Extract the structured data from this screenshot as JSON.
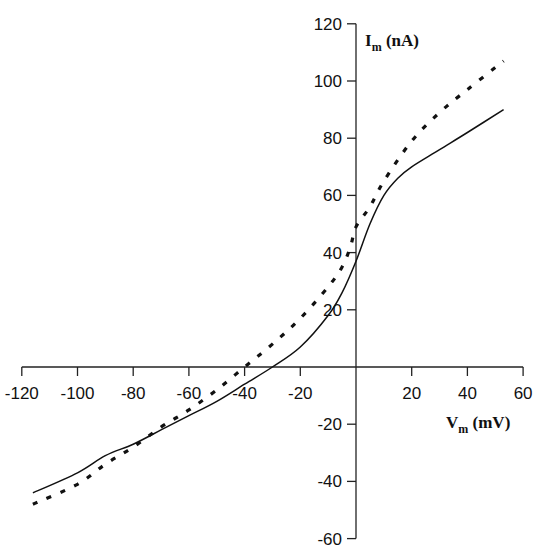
{
  "chart_data": {
    "type": "line",
    "title": "",
    "xlabel": "V_m (mV)",
    "ylabel": "I_m (nA)",
    "xlabel_main": "V",
    "xlabel_sub": "m",
    "xlabel_unit": " (mV)",
    "ylabel_main": "I",
    "ylabel_sub": "m",
    "ylabel_unit": " (nA)",
    "xlim": [
      -120,
      60
    ],
    "ylim": [
      -60,
      120
    ],
    "x_ticks": [
      -120,
      -100,
      -80,
      -60,
      -40,
      -20,
      20,
      40,
      60
    ],
    "y_ticks": [
      120,
      100,
      80,
      60,
      40,
      20,
      -20,
      -40,
      -60
    ],
    "grid": false,
    "legend": null,
    "series": [
      {
        "name": "solid",
        "style": "solid",
        "x": [
          -116,
          -100,
          -90,
          -80,
          -70,
          -60,
          -50,
          -40,
          -30,
          -20,
          -10,
          -5,
          0,
          5,
          10,
          15,
          20,
          30,
          40,
          53
        ],
        "y": [
          -44,
          -37,
          -31,
          -27,
          -22,
          -17,
          -12,
          -6,
          0,
          7,
          18,
          26,
          37,
          50,
          60,
          66,
          70,
          76,
          82,
          90
        ]
      },
      {
        "name": "dashed",
        "style": "dashed",
        "x": [
          -116,
          -100,
          -90,
          -80,
          -70,
          -60,
          -50,
          -40,
          -30,
          -20,
          -10,
          -5,
          -2,
          0,
          5,
          10,
          20,
          30,
          40,
          53
        ],
        "y": [
          -48,
          -41,
          -34,
          -28,
          -21,
          -15,
          -8,
          0,
          8,
          17,
          28,
          35,
          42,
          49,
          56,
          65,
          79,
          89,
          97,
          107
        ]
      }
    ]
  }
}
